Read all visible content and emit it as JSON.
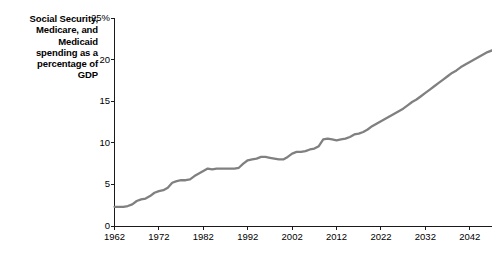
{
  "chart_data": {
    "type": "line",
    "title": "Social Security, Medicare, and Medicaid spending as a percentage of GDP",
    "title_lines": [
      "Social Security,",
      "Medicare, and",
      "Medicaid",
      "spending as a",
      "percentage of",
      "GDP"
    ],
    "xlabel": "",
    "ylabel": "",
    "grid": false,
    "legend": false,
    "line_color": "#808080",
    "axis_color": "#1a1a1a",
    "text_color": "#000000",
    "background_color": "#ffffff",
    "xlim": [
      1962,
      2047
    ],
    "ylim": [
      0,
      25
    ],
    "y_ticks": [
      0,
      5,
      10,
      15,
      20,
      25
    ],
    "y_tick_labels": [
      "0",
      "5",
      "10",
      "15",
      "20",
      "25%"
    ],
    "x_ticks": [
      1962,
      1972,
      1982,
      1992,
      2002,
      2012,
      2022,
      2032,
      2042
    ],
    "x_tick_labels": [
      "1962",
      "1972",
      "1982",
      "1992",
      "2002",
      "2012",
      "2022",
      "2032",
      "2042"
    ],
    "series": [
      {
        "name": "Social Security, Medicare, and Medicaid spending",
        "units": "percent of GDP",
        "x": [
          1962,
          1963,
          1964,
          1965,
          1966,
          1967,
          1968,
          1969,
          1970,
          1971,
          1972,
          1973,
          1974,
          1975,
          1976,
          1977,
          1978,
          1979,
          1980,
          1981,
          1982,
          1983,
          1984,
          1985,
          1986,
          1987,
          1988,
          1989,
          1990,
          1991,
          1992,
          1993,
          1994,
          1995,
          1996,
          1997,
          1998,
          1999,
          2000,
          2001,
          2002,
          2003,
          2004,
          2005,
          2006,
          2007,
          2008,
          2009,
          2010,
          2011,
          2012,
          2013,
          2014,
          2015,
          2016,
          2017,
          2018,
          2019,
          2020,
          2021,
          2022,
          2023,
          2024,
          2025,
          2026,
          2027,
          2028,
          2029,
          2030,
          2031,
          2032,
          2033,
          2034,
          2035,
          2036,
          2037,
          2038,
          2039,
          2040,
          2041,
          2042,
          2043,
          2044,
          2045,
          2046,
          2047
        ],
        "y": [
          2.3,
          2.3,
          2.3,
          2.4,
          2.6,
          3.0,
          3.2,
          3.3,
          3.6,
          4.0,
          4.2,
          4.3,
          4.6,
          5.2,
          5.4,
          5.5,
          5.5,
          5.6,
          6.0,
          6.3,
          6.6,
          6.9,
          6.8,
          6.9,
          6.9,
          6.9,
          6.9,
          6.9,
          7.0,
          7.5,
          7.9,
          8.0,
          8.1,
          8.3,
          8.3,
          8.2,
          8.1,
          8.0,
          8.0,
          8.3,
          8.7,
          8.9,
          8.9,
          9.0,
          9.2,
          9.3,
          9.6,
          10.4,
          10.5,
          10.4,
          10.3,
          10.4,
          10.5,
          10.7,
          11.0,
          11.1,
          11.3,
          11.6,
          12.0,
          12.3,
          12.6,
          12.9,
          13.2,
          13.5,
          13.8,
          14.1,
          14.5,
          14.9,
          15.2,
          15.6,
          16.0,
          16.4,
          16.8,
          17.2,
          17.6,
          18.0,
          18.4,
          18.7,
          19.1,
          19.4,
          19.7,
          20.0,
          20.3,
          20.6,
          20.9,
          21.1
        ]
      }
    ]
  }
}
